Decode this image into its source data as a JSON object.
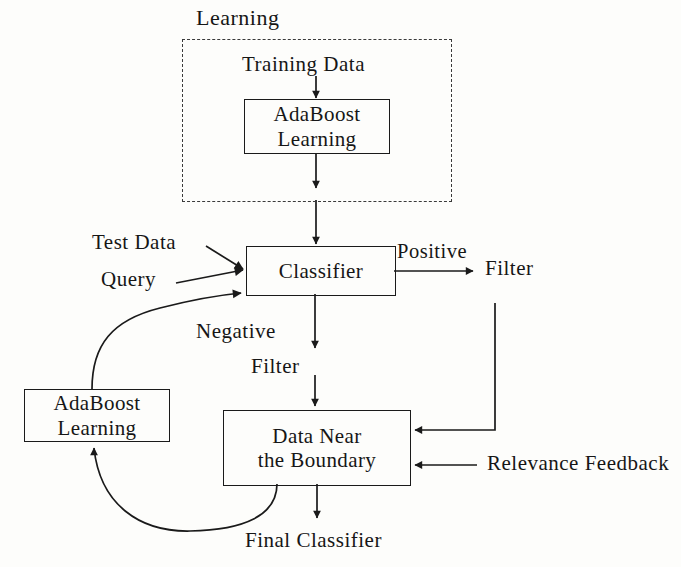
{
  "diagram": {
    "title_label": "Learning",
    "type": "flowchart",
    "stroke_color": "#1a1a1a",
    "dashed_color": "#3a3a3a",
    "background_color": "#fdfdfb",
    "group": {
      "name": "learning-phase-group",
      "label": "Learning",
      "border_style": "dashed"
    },
    "nodes": [
      {
        "id": "training-data",
        "kind": "label",
        "text": "Training Data"
      },
      {
        "id": "adaboost-learning-top",
        "kind": "box",
        "line1": "AdaBoost",
        "line2": "Learning"
      },
      {
        "id": "classifier",
        "kind": "box",
        "line1": "Classifier"
      },
      {
        "id": "test-data",
        "kind": "label",
        "text": "Test Data"
      },
      {
        "id": "query",
        "kind": "label",
        "text": "Query"
      },
      {
        "id": "positive",
        "kind": "edge-label",
        "text": "Positive"
      },
      {
        "id": "filter-positive",
        "kind": "label",
        "text": "Filter"
      },
      {
        "id": "negative",
        "kind": "edge-label",
        "text": "Negative"
      },
      {
        "id": "filter-negative",
        "kind": "label",
        "text": "Filter"
      },
      {
        "id": "adaboost-learning-bottom",
        "kind": "box",
        "line1": "AdaBoost",
        "line2": "Learning"
      },
      {
        "id": "data-near-boundary",
        "kind": "box",
        "line1": "Data Near",
        "line2": "the Boundary"
      },
      {
        "id": "relevance-feedback",
        "kind": "label",
        "text": "Relevance Feedback"
      },
      {
        "id": "final-classifier",
        "kind": "label",
        "text": "Final Classifier"
      }
    ],
    "edges": [
      {
        "from": "training-data",
        "to": "adaboost-learning-top",
        "label": ""
      },
      {
        "from": "adaboost-learning-top",
        "to": "classifier",
        "label": ""
      },
      {
        "from": "test-data",
        "to": "classifier",
        "label": ""
      },
      {
        "from": "query",
        "to": "classifier",
        "label": ""
      },
      {
        "from": "classifier",
        "to": "filter-positive",
        "label": "Positive"
      },
      {
        "from": "classifier",
        "to": "data-near-boundary",
        "label": "Negative"
      },
      {
        "from": "filter-positive",
        "to": "data-near-boundary",
        "label": ""
      },
      {
        "from": "relevance-feedback",
        "to": "data-near-boundary",
        "label": ""
      },
      {
        "from": "data-near-boundary",
        "to": "adaboost-learning-bottom",
        "label": ""
      },
      {
        "from": "adaboost-learning-bottom",
        "to": "classifier",
        "label": ""
      },
      {
        "from": "data-near-boundary",
        "to": "final-classifier",
        "label": ""
      }
    ]
  }
}
